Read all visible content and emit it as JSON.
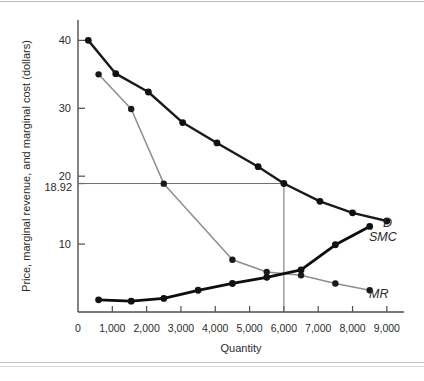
{
  "figure": {
    "background": "#ffffff",
    "border_color": "#b9b9b9"
  },
  "axes": {
    "y_title": "Price, marginal revenue, and marginal cost (dollars)",
    "x_title": "Quantity",
    "y_ticks": [
      "40",
      "30",
      "20",
      "10"
    ],
    "y_special_tick": "18.92",
    "x_ticks": [
      "0",
      "1,000",
      "2,000",
      "3,000",
      "4,000",
      "5,000",
      "6,000",
      "7,000",
      "8,000",
      "9,000"
    ]
  },
  "series_labels": {
    "demand": "D",
    "marginal_cost": "SMC",
    "marginal_revenue": "MR"
  },
  "colors": {
    "demand": "#1a1a1a",
    "marginal_cost": "#0d0d0d",
    "marginal_revenue": "#8d8d8d",
    "axis": "#4d4d4d",
    "guide": "#6e6e6e"
  },
  "equilibrium": {
    "price": "18.92",
    "quantity": "6,000"
  },
  "chart_data": {
    "type": "line",
    "title": "",
    "xlabel": "Quantity",
    "ylabel": "Price, marginal revenue, and marginal cost (dollars)",
    "xlim": [
      0,
      9500
    ],
    "ylim": [
      0,
      43
    ],
    "xticks": [
      0,
      1000,
      2000,
      3000,
      4000,
      5000,
      6000,
      7000,
      8000,
      9000
    ],
    "yticks": [
      10,
      20,
      30,
      40
    ],
    "extra_yticks": [
      18.92
    ],
    "grid": false,
    "legend": "inline-right-of-curve-ends",
    "annotations": [
      {
        "text": "18.92",
        "type": "y-reference-line",
        "value": 18.92
      },
      {
        "text": "6,000",
        "type": "x-reference-line",
        "value": 6000
      }
    ],
    "series": [
      {
        "name": "D",
        "label": "Demand",
        "color": "#1a1a1a",
        "style": "thick-black",
        "x": [
          300,
          1100,
          2050,
          3050,
          4050,
          5250,
          6000,
          7050,
          8000,
          9000
        ],
        "y": [
          40.0,
          35.1,
          32.4,
          27.9,
          24.9,
          21.4,
          18.92,
          16.3,
          14.6,
          13.4
        ]
      },
      {
        "name": "SMC",
        "label": "Short-run marginal cost",
        "color": "#0d0d0d",
        "style": "thick-black",
        "x": [
          600,
          1550,
          2500,
          3500,
          4500,
          5500,
          6500,
          7500,
          8500
        ],
        "y": [
          1.8,
          1.6,
          2.0,
          3.2,
          4.2,
          5.1,
          6.2,
          9.9,
          12.6
        ]
      },
      {
        "name": "MR",
        "label": "Marginal revenue",
        "color": "#8d8d8d",
        "style": "thin-gray",
        "x": [
          600,
          1550,
          2500,
          4500,
          5500,
          6500,
          7500,
          8500
        ],
        "y": [
          35.0,
          29.9,
          18.9,
          7.7,
          5.9,
          5.4,
          4.2,
          3.2
        ]
      }
    ]
  }
}
